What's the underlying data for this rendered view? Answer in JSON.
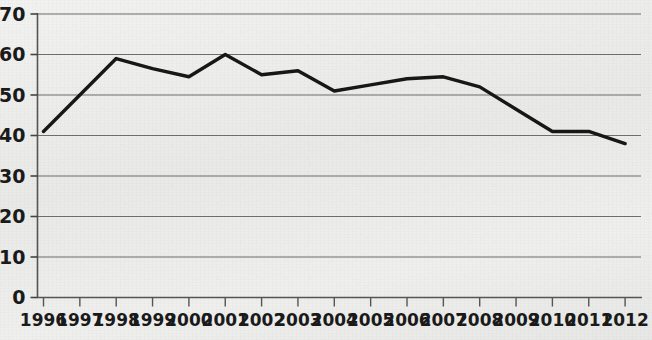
{
  "chart_data": {
    "type": "line",
    "title": "",
    "subtitle": "",
    "xlabel": "",
    "ylabel": "",
    "categories": [
      "1996",
      "1997",
      "1998",
      "1999",
      "2000",
      "2001",
      "2002",
      "2003",
      "2004",
      "2005",
      "2006",
      "2007",
      "2008",
      "2009",
      "2010",
      "2011",
      "2012"
    ],
    "values": [
      41,
      50,
      59,
      56.5,
      54.5,
      60,
      55,
      56,
      51,
      52.5,
      54,
      54.5,
      52,
      46.5,
      41,
      41,
      38
    ],
    "series": [
      {
        "name": "",
        "values": [
          41,
          50,
          59,
          56.5,
          54.5,
          60,
          55,
          56,
          51,
          52.5,
          54,
          54.5,
          52,
          46.5,
          41,
          41,
          38
        ]
      }
    ],
    "ylim": [
      0,
      70
    ],
    "ytick_values": [
      0,
      10,
      20,
      30,
      40,
      50,
      60,
      70
    ],
    "ytick_labels": [
      "0",
      "10",
      "20",
      "30",
      "40",
      "50",
      "60",
      "70"
    ],
    "xtick_labels": [
      "1996",
      "1997",
      "1998",
      "1999",
      "2000",
      "2001",
      "2002",
      "2003",
      "2004",
      "2005",
      "2006",
      "2007",
      "2008",
      "2009",
      "2010",
      "2011",
      "2012"
    ],
    "grid": "horizontal",
    "legend": "none",
    "markers": "none",
    "annotations": [],
    "line_color": "#171717",
    "grid_color": "#6d6d6d",
    "axis_color": "#555555",
    "background_color": "#eeeeec",
    "text_color": "#1a1a1a"
  }
}
